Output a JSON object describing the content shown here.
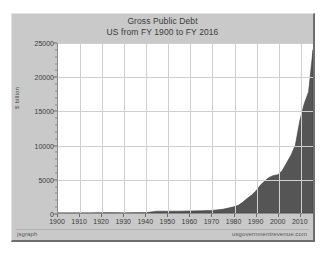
{
  "chart_data": {
    "type": "area",
    "title": "Gross Public Debt",
    "subtitle": "US from FY 1900 to FY 2016",
    "xlabel": "",
    "ylabel": "$ billion",
    "xlim": [
      1900,
      2016
    ],
    "ylim": [
      0,
      25000
    ],
    "grid": true,
    "legend": "none",
    "fill_color": "#555555",
    "x_ticks": [
      1900,
      1910,
      1920,
      1930,
      1940,
      1950,
      1960,
      1970,
      1980,
      1990,
      2000,
      2010
    ],
    "y_ticks": [
      0,
      5000,
      10000,
      15000,
      20000,
      25000
    ],
    "x": [
      1900,
      1905,
      1910,
      1915,
      1920,
      1925,
      1930,
      1935,
      1940,
      1945,
      1950,
      1955,
      1960,
      1965,
      1970,
      1975,
      1980,
      1982,
      1984,
      1986,
      1988,
      1990,
      1992,
      1994,
      1996,
      1998,
      2000,
      2002,
      2004,
      2006,
      2008,
      2010,
      2012,
      2014,
      2016
    ],
    "values": [
      2,
      2,
      3,
      3,
      26,
      21,
      16,
      29,
      51,
      260,
      257,
      274,
      291,
      323,
      381,
      542,
      909,
      1142,
      1573,
      2125,
      2602,
      3233,
      4065,
      4693,
      5225,
      5526,
      5629,
      6228,
      7379,
      8507,
      10025,
      13562,
      16066,
      17824,
      24000
    ],
    "annotations": {
      "footer_left": "jsgraph",
      "footer_right": "usgovernmentrevenue.com"
    }
  },
  "chart": {
    "title_line_1": "Gross Public Debt",
    "title_line_2": "US from FY 1900 to FY 2016",
    "y_axis_title": "$ billion",
    "footer_left": "jsgraph",
    "footer_right": "usgovernmentrevenue.com",
    "y_tick_labels": [
      "25000",
      "20000",
      "15000",
      "10000",
      "5000",
      "0"
    ],
    "x_tick_labels": [
      "1900",
      "1910",
      "1920",
      "1930",
      "1940",
      "1950",
      "1960",
      "1970",
      "1980",
      "1990",
      "2000",
      "2010"
    ]
  }
}
